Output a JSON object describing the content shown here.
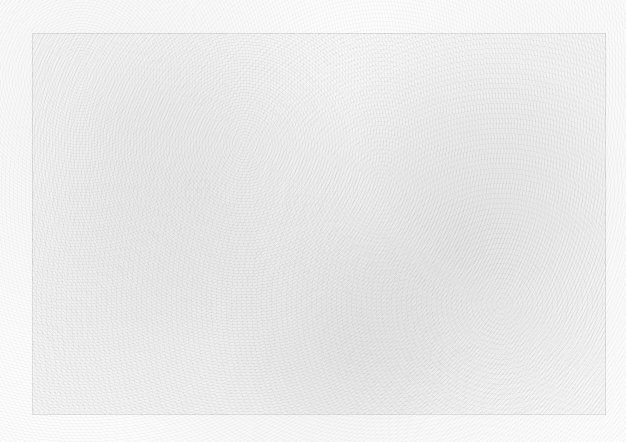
{
  "canvas": {
    "background_color": "#fcfcfc",
    "texture": "grainy-noise"
  },
  "frame": {
    "border_color": "#e8e8e8",
    "label": ""
  }
}
